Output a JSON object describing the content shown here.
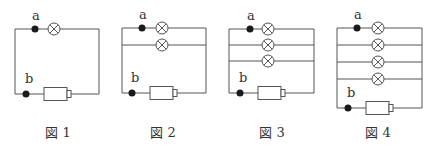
{
  "figures": [
    {
      "id": "fig1",
      "caption": "図 1",
      "lamp_count": 1,
      "terminal_a": "a",
      "terminal_b": "b"
    },
    {
      "id": "fig2",
      "caption": "図 2",
      "lamp_count": 2,
      "terminal_a": "a",
      "terminal_b": "b"
    },
    {
      "id": "fig3",
      "caption": "図 3",
      "lamp_count": 3,
      "terminal_a": "a",
      "terminal_b": "b"
    },
    {
      "id": "fig4",
      "caption": "図 4",
      "lamp_count": 4,
      "terminal_a": "a",
      "terminal_b": "b"
    }
  ],
  "components": {
    "lamp": "lamp-icon",
    "battery": "battery-icon",
    "terminal": "terminal-dot"
  }
}
